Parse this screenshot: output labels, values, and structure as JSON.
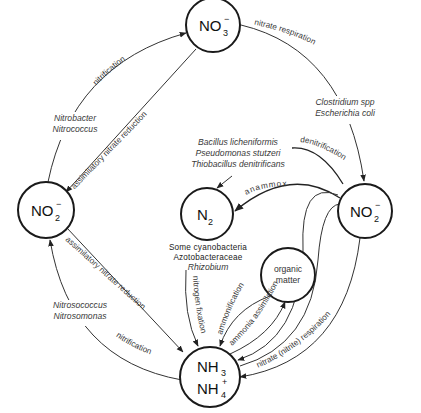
{
  "nodes": {
    "no3": {
      "main": "NO",
      "sub": "3",
      "sup": "−"
    },
    "no2_left": {
      "main": "NO",
      "sub": "2",
      "sup": "−"
    },
    "no2_right": {
      "main": "NO",
      "sub": "2",
      "sup": "−"
    },
    "n2": {
      "main": "N",
      "sub": "2"
    },
    "organic_matter": {
      "line1": "organic",
      "line2": "matter"
    },
    "nh3": {
      "main": "NH",
      "sub": "3"
    },
    "nh4": {
      "main": "NH",
      "sub": "4",
      "sup": "+"
    }
  },
  "processes": {
    "nitrification_top": "nitrification",
    "assimilatory_top": "assimilatory nitrate reduction",
    "nitrate_respiration": "nitrate respiration",
    "denitrification": "denitrification",
    "anammox": "anammox",
    "assimilatory_bottom": "assimilatory nitrate reduction",
    "nitrification_bottom": "nitrification",
    "nitrogen_fixation": "nitrogen fixation",
    "ammonification": "ammonification",
    "ammonia_assimilation": "ammonia assimilation",
    "nitrate_nitrite_respiration": "nitrate (nitrite) respiration"
  },
  "organisms": {
    "nitrobacter": "Nitrobacter",
    "nitrococcus": "Nitrococcus",
    "clostridium": "Clostridium spp",
    "escherichia": "Escherichia coli",
    "bacillus": "Bacillus licheniformis",
    "pseudomonas": "Pseudomonas stutzeri",
    "thiobacillus": "Thiobacillus denitrificans",
    "cyanobacteria": "Some cyanobacteria",
    "azotobacteraceae": "Azotobacteraceae",
    "rhizobium": "Rhizobium",
    "nitrosococcus": "Nitrosococcus",
    "nitrosomonas": "Nitrosomonas"
  }
}
